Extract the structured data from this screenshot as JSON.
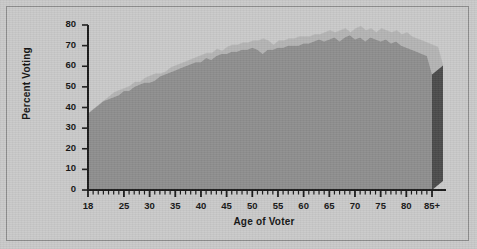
{
  "chart_data": {
    "type": "area",
    "title": "",
    "xlabel": "Age of Voter",
    "ylabel": "Percent Voting",
    "xlim": [
      18,
      86
    ],
    "ylim": [
      0,
      80
    ],
    "grid": false,
    "legend": null,
    "style": "3d-ribbon-area",
    "colors": {
      "background": "#c9c9c9",
      "area_front": "#8e8e8e",
      "ribbon_top": "#b4b4b4",
      "side_face": "#4a4a4a",
      "axis": "#1a1a1a",
      "border": "#8d8d8d"
    },
    "y_ticks": [
      0,
      10,
      20,
      30,
      40,
      50,
      60,
      70,
      80
    ],
    "x_ticks_major": [
      18,
      25,
      30,
      35,
      40,
      45,
      50,
      55,
      60,
      65,
      70,
      75,
      80,
      85
    ],
    "x_tick_labels": [
      "18",
      "25",
      "30",
      "35",
      "40",
      "45",
      "50",
      "55",
      "60",
      "65",
      "70",
      "75",
      "80",
      "85+"
    ],
    "x_minor_tick_step": 1,
    "categories": [
      18,
      19,
      20,
      21,
      22,
      23,
      24,
      25,
      26,
      27,
      28,
      29,
      30,
      31,
      32,
      33,
      34,
      35,
      36,
      37,
      38,
      39,
      40,
      41,
      42,
      43,
      44,
      45,
      46,
      47,
      48,
      49,
      50,
      51,
      52,
      53,
      54,
      55,
      56,
      57,
      58,
      59,
      60,
      61,
      62,
      63,
      64,
      65,
      66,
      67,
      68,
      69,
      70,
      71,
      72,
      73,
      74,
      75,
      76,
      77,
      78,
      79,
      80,
      81,
      82,
      83,
      84,
      85
    ],
    "values": [
      37,
      39,
      41,
      43,
      44,
      45,
      46,
      48,
      48,
      50,
      51,
      52,
      52,
      53,
      55,
      56,
      57,
      58,
      59,
      60,
      61,
      62,
      62,
      64,
      63,
      65,
      66,
      66,
      67,
      67,
      68,
      68,
      69,
      68,
      66,
      68,
      68,
      69,
      69,
      70,
      70,
      70,
      71,
      71,
      72,
      73,
      72,
      73,
      74,
      72,
      74,
      75,
      73,
      74,
      72,
      74,
      73,
      72,
      73,
      71,
      72,
      70,
      69,
      68,
      67,
      66,
      65,
      56
    ],
    "series": [
      {
        "name": "Percent Voting",
        "values": [
          37,
          39,
          41,
          43,
          44,
          45,
          46,
          48,
          48,
          50,
          51,
          52,
          52,
          53,
          55,
          56,
          57,
          58,
          59,
          60,
          61,
          62,
          62,
          64,
          63,
          65,
          66,
          66,
          67,
          67,
          68,
          68,
          69,
          68,
          66,
          68,
          68,
          69,
          69,
          70,
          70,
          70,
          71,
          71,
          72,
          73,
          72,
          73,
          74,
          72,
          74,
          75,
          73,
          74,
          72,
          74,
          73,
          72,
          73,
          71,
          72,
          70,
          69,
          68,
          67,
          66,
          65,
          56
        ]
      }
    ],
    "annotations": []
  },
  "figure": {
    "y_axis_title": "Percent Voting",
    "x_axis_title": "Age of Voter"
  }
}
